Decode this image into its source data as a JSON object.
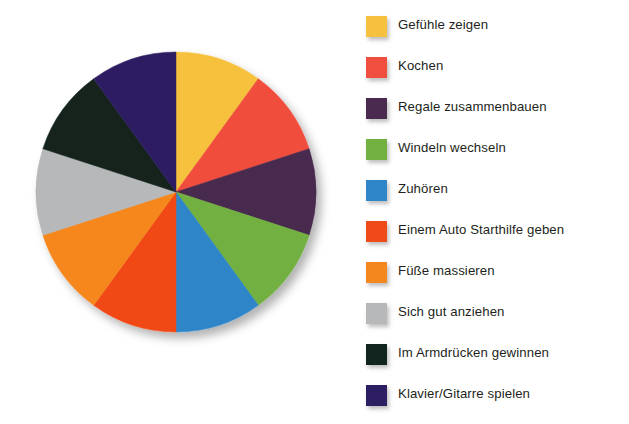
{
  "chart_data": {
    "type": "pie",
    "title": "",
    "subtitle": "",
    "xlabel": "",
    "ylabel": "",
    "grid": false,
    "legend_position": "right",
    "start_angle_deg": 0,
    "direction": "clockwise",
    "total": 100,
    "labels": [
      "Gefühle zeigen",
      "Kochen",
      "Regale zusammenbauen",
      "Windeln wechseln",
      "Zuhören",
      "Einem Auto Starthilfe geben",
      "Füße massieren",
      "Sich gut anziehen",
      "Im Armdrücken gewinnen",
      "Klavier/Gitarre spielen"
    ],
    "values": [
      10,
      10,
      10,
      10,
      10,
      10,
      10,
      10,
      10,
      10
    ],
    "slice_angles_deg": [
      36,
      36,
      36,
      36,
      36,
      36,
      36,
      36,
      36,
      36
    ],
    "colors": [
      "#F6C13E",
      "#F04E3E",
      "#4A2B4F",
      "#72B042",
      "#2E86C8",
      "#F04A18",
      "#F5871F",
      "#B6B8BA",
      "#12241E",
      "#2D1E63"
    ]
  },
  "legend": {
    "items": [
      {
        "label": "Gefühle zeigen",
        "color": "#F6C13E"
      },
      {
        "label": "Kochen",
        "color": "#F04E3E"
      },
      {
        "label": "Regale zusammenbauen",
        "color": "#4A2B4F"
      },
      {
        "label": "Windeln wechseln",
        "color": "#72B042"
      },
      {
        "label": "Zuhören",
        "color": "#2E86C8"
      },
      {
        "label": "Einem Auto Starthilfe geben",
        "color": "#F04A18"
      },
      {
        "label": "Füße massieren",
        "color": "#F5871F"
      },
      {
        "label": "Sich gut anziehen",
        "color": "#B6B8BA"
      },
      {
        "label": "Im Armdrücken gewinnen",
        "color": "#12241E"
      },
      {
        "label": "Klavier/Gitarre spielen",
        "color": "#2D1E63"
      }
    ]
  },
  "canvas": {
    "background": "#FFFFFF",
    "text_color": "#231F20"
  }
}
